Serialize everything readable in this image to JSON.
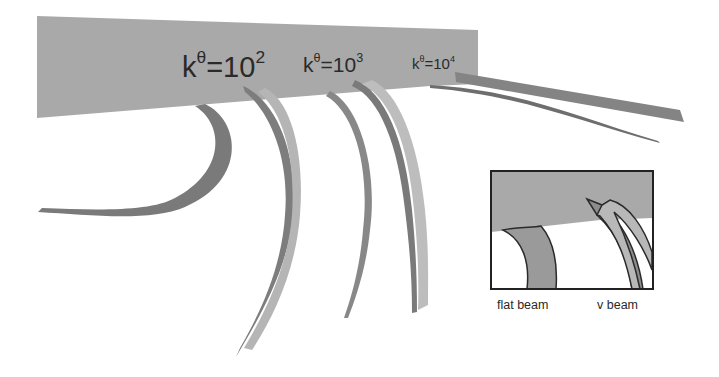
{
  "figure": {
    "plate_color": "#a9a9a9",
    "beam_dark_color": "#7d7d7d",
    "beam_mid_color": "#9a9a9a",
    "beam_light_color": "#bdbdbd",
    "labels": [
      {
        "symbol": "k",
        "superscript": "θ",
        "equals": "=10",
        "exponent": "2"
      },
      {
        "symbol": "k",
        "superscript": "θ",
        "equals": "=10",
        "exponent": "3"
      },
      {
        "symbol": "k",
        "superscript": "θ",
        "equals": "=10",
        "exponent": "4"
      }
    ],
    "inset": {
      "captions": [
        "flat beam",
        "v beam"
      ]
    }
  }
}
